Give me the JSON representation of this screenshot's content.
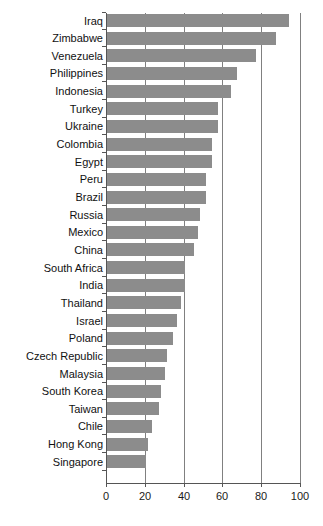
{
  "chart_data": {
    "type": "bar",
    "orientation": "horizontal",
    "title": "",
    "subtitle": "",
    "xlabel": "",
    "ylabel": "",
    "xlim": [
      0,
      100
    ],
    "ylim": null,
    "grid": true,
    "legend": null,
    "legend_position": "none",
    "xticks": [
      0,
      20,
      40,
      60,
      80,
      100
    ],
    "xtick_labels": [
      "0",
      "20",
      "40",
      "60",
      "80",
      "100"
    ],
    "categories": [
      "Iraq",
      "Zimbabwe",
      "Venezuela",
      "Philippines",
      "Indonesia",
      "Turkey",
      "Ukraine",
      "Colombia",
      "Egypt",
      "Peru",
      "Brazil",
      "Russia",
      "Mexico",
      "China",
      "South Africa",
      "India",
      "Thailand",
      "Israel",
      "Poland",
      "Czech Republic",
      "Malaysia",
      "South Korea",
      "Taiwan",
      "Chile",
      "Hong Kong",
      "Singapore"
    ],
    "values": [
      94,
      87,
      77,
      67,
      64,
      57,
      57,
      54,
      54,
      51,
      51,
      48,
      47,
      45,
      40,
      40,
      38,
      36,
      34,
      31,
      30,
      28,
      27,
      23,
      21,
      20
    ],
    "colors": {
      "bar": "#8c8c8c",
      "axis": "#555555",
      "gridline": "#808080",
      "text": "#111111",
      "background": "#ffffff"
    }
  }
}
